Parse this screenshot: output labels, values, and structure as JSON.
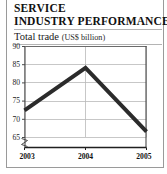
{
  "headline": {
    "line1": "SERVICE",
    "line2": "INDUSTRY PERFORMANCE"
  },
  "subtitle": {
    "label": "Total trade ",
    "units": "(US$ billion)"
  },
  "chart_data": {
    "type": "line",
    "title": "SERVICE INDUSTRY PERFORMANCE",
    "subtitle": "Total trade (US$ billion)",
    "xlabel": "",
    "ylabel": "US$ billion",
    "categories": [
      "2003",
      "2004",
      "2005"
    ],
    "x": [
      2003,
      2004,
      2005
    ],
    "values": [
      72.3,
      84.0,
      66.5
    ],
    "series": [
      {
        "name": "Total trade",
        "values": [
          72.3,
          84.0,
          66.5
        ],
        "color": "#2b2b2b"
      }
    ],
    "ylim": [
      63,
      90
    ],
    "yticks": [
      90,
      85,
      80,
      75,
      70,
      65
    ],
    "ytick_labels": [
      "90",
      "85",
      "80",
      "75",
      "70",
      "65"
    ],
    "xtick_labels": [
      "2003",
      "2004",
      "2005"
    ],
    "grid": true,
    "axis_break": true,
    "legend": "none",
    "line_color": "#2b2b2b",
    "grid_color": "#b9b9b9",
    "axis_color": "#4a4a4a"
  }
}
